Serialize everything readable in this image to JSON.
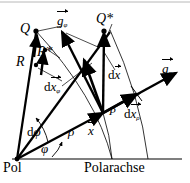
{
  "figure": {
    "background": "#ffffff",
    "stroke": "#000000",
    "width": 190,
    "height": 183
  },
  "axis": {
    "pole_label": "Pol",
    "axis_label": "Polarachse"
  },
  "points": {
    "Q": "Q",
    "Qstar": "Q*",
    "P": "P"
  },
  "vectors": {
    "R": "R",
    "Rstar": "R*",
    "x": "x",
    "dx": "d",
    "dx_vecletter": "x",
    "dx_rho": "d",
    "dx_rho_letter": "x",
    "dx_rho_sub": "ρ",
    "dx_phi": "d",
    "dx_phi_letter": "x",
    "dx_phi_sub": "φ",
    "g_rho": "g",
    "g_rho_sub": "ρ",
    "g_phi": "g",
    "g_phi_sub": "φ"
  },
  "angles": {
    "phi": "φ",
    "dphi": "d",
    "dphi_letter": "φ"
  },
  "scalars": {
    "rho": "ρ"
  }
}
